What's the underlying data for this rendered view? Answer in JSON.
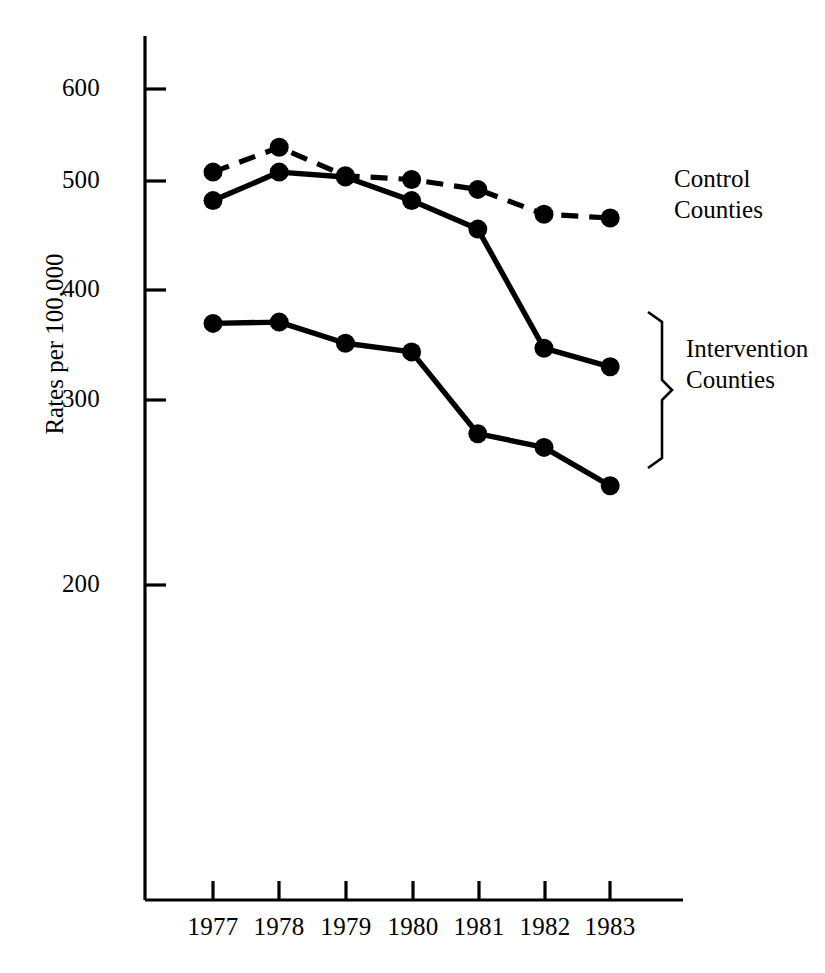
{
  "chart_data": {
    "type": "line",
    "title": "",
    "subtitle": "",
    "xlabel": "",
    "ylabel": "Rates per 100,000",
    "categories": [
      "1977",
      "1978",
      "1979",
      "1980",
      "1981",
      "1982",
      "1983"
    ],
    "x": [
      1977,
      1978,
      1979,
      1980,
      1981,
      1982,
      1983
    ],
    "xlim": [
      1976.5,
      1983.9
    ],
    "ylim": [
      130,
      640
    ],
    "yticks": [
      200,
      300,
      400,
      500,
      600
    ],
    "ytick_labels": [
      "200",
      "300",
      "400",
      "500",
      "600"
    ],
    "grid": false,
    "legend_position": "right-inline-annotations",
    "series": [
      {
        "name": "Control Counties",
        "style": "dashed",
        "marker": "filled-circle",
        "values": [
          533,
          553,
          530,
          527,
          519,
          499,
          496
        ]
      },
      {
        "name": "Intervention Counties (upper)",
        "style": "solid",
        "marker": "filled-circle",
        "values": [
          510,
          533,
          529,
          510,
          487,
          391,
          376
        ]
      },
      {
        "name": "Intervention Counties (lower)",
        "style": "solid",
        "marker": "filled-circle",
        "values": [
          411,
          412,
          395,
          388,
          322,
          311,
          280
        ]
      }
    ],
    "annotations": [
      {
        "id": "control",
        "lines": [
          "Control",
          "Counties"
        ],
        "attached_to": "Control Counties"
      },
      {
        "id": "intervention",
        "lines": [
          "Intervention",
          "Counties"
        ],
        "attached_to": "Intervention Counties",
        "bracket": true
      }
    ]
  },
  "axis": {
    "y_title": "Rates per 100,000",
    "y_ticks": [
      "600",
      "500",
      "400",
      "300",
      "200"
    ],
    "x_ticks": [
      "1977",
      "1978",
      "1979",
      "1980",
      "1981",
      "1982",
      "1983"
    ]
  },
  "annotations": {
    "control": {
      "line1": "Control",
      "line2": "Counties"
    },
    "intervention": {
      "line1": "Intervention",
      "line2": "Counties"
    }
  },
  "colors": {
    "ink": "#000000",
    "background": "#ffffff"
  }
}
